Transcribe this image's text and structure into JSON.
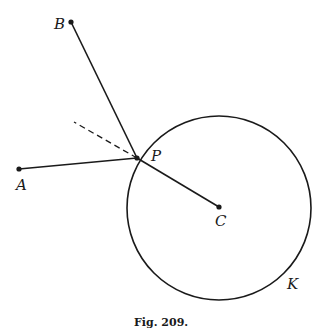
{
  "figure": {
    "caption": "Fig. 209.",
    "stroke_color": "#1a1a1a",
    "background": "#ffffff"
  },
  "points": {
    "A": {
      "label": "A",
      "x": 19,
      "y": 169
    },
    "B": {
      "label": "B",
      "x": 71,
      "y": 22
    },
    "P": {
      "label": "P",
      "x": 137,
      "y": 158
    },
    "C": {
      "label": "C",
      "x": 219,
      "y": 207
    }
  },
  "circle": {
    "label": "K",
    "cx": 219,
    "cy": 208,
    "r": 92
  },
  "segments": [
    {
      "from": "B",
      "to": "P",
      "style": "solid"
    },
    {
      "from": "A",
      "to": "P",
      "style": "solid"
    },
    {
      "from": "P",
      "to": "C",
      "style": "solid"
    },
    {
      "from": "P",
      "to": "dash_end",
      "style": "dashed"
    }
  ],
  "dash_end": {
    "x": 74,
    "y": 122
  }
}
